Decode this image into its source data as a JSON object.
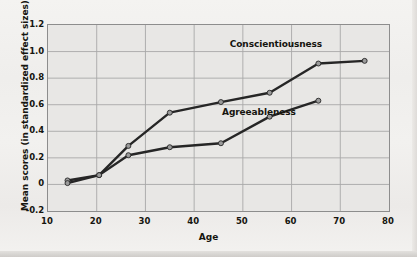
{
  "chart_data": {
    "type": "line",
    "title": "",
    "xlabel": "Age",
    "ylabel": "Mean scores (in standardized effect sizes)",
    "xlim": [
      10,
      80
    ],
    "ylim": [
      -0.2,
      1.2
    ],
    "xticks": [
      10,
      20,
      30,
      40,
      50,
      60,
      70,
      80
    ],
    "yticks": [
      -0.2,
      0,
      0.2,
      0.4,
      0.6,
      0.8,
      1.0,
      1.2
    ],
    "ytick_labels": [
      "-0.2",
      "0",
      "0.2",
      "0.4",
      "0.6",
      "0.8",
      "1.0",
      "1.2"
    ],
    "xtick_labels": [
      "10",
      "20",
      "30",
      "40",
      "50",
      "60",
      "70",
      "80"
    ],
    "grid": true,
    "legend_position": "inline-annotations",
    "series": [
      {
        "name": "Conscientiousness",
        "color": "#262626",
        "marker_color": "#9a9a9a",
        "label_x": 57,
        "label_y": 1.04,
        "points": [
          {
            "x": 14,
            "y": 0.03
          },
          {
            "x": 20.5,
            "y": 0.07
          },
          {
            "x": 26.5,
            "y": 0.29
          },
          {
            "x": 35,
            "y": 0.54
          },
          {
            "x": 45.5,
            "y": 0.62
          },
          {
            "x": 55.5,
            "y": 0.69
          },
          {
            "x": 65.5,
            "y": 0.91
          },
          {
            "x": 75,
            "y": 0.93
          }
        ]
      },
      {
        "name": "Agreeableness",
        "color": "#262626",
        "marker_color": "#9a9a9a",
        "label_x": 53.5,
        "label_y": 0.53,
        "points": [
          {
            "x": 14,
            "y": 0.01
          },
          {
            "x": 20.5,
            "y": 0.07
          },
          {
            "x": 26.5,
            "y": 0.22
          },
          {
            "x": 35,
            "y": 0.28
          },
          {
            "x": 45.5,
            "y": 0.31
          },
          {
            "x": 55.5,
            "y": 0.51
          },
          {
            "x": 65.5,
            "y": 0.63
          }
        ]
      }
    ],
    "colors": {
      "plot_background": "#e8e7e5",
      "figure_background": "#f1f0ee",
      "grid": "#a8a8a8",
      "axis_border": "#8d8d8d",
      "text": "#16150f",
      "line": "#262626",
      "marker_fill": "#9a9a9a"
    }
  }
}
